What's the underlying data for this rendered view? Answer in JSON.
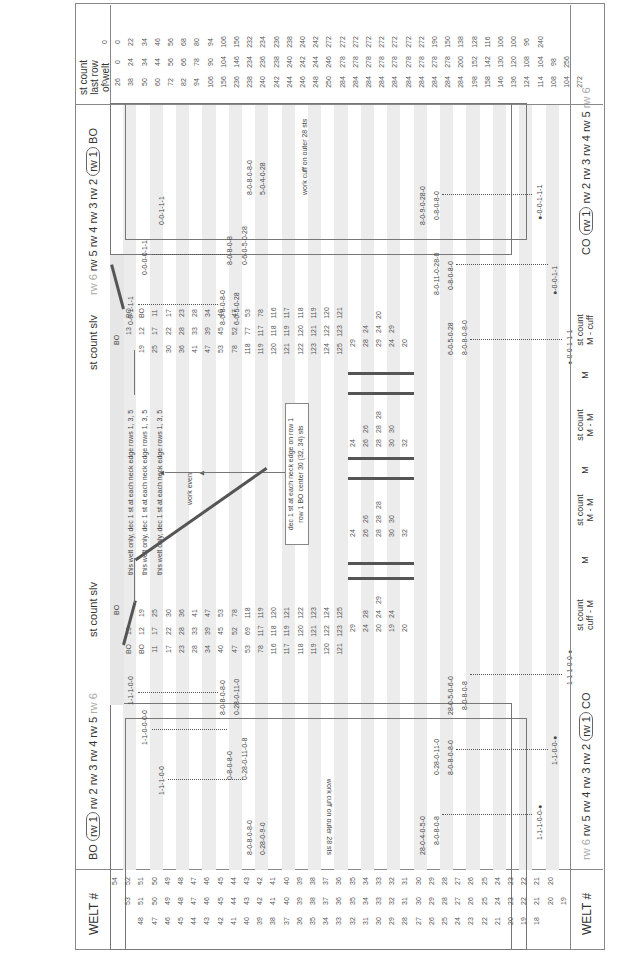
{
  "header": {
    "welt_label": "WELT #",
    "left_rows_label": {
      "bo": "BO",
      "rw1": "rw 1",
      "rest": "rw 2  rw 3  rw 4  rw 5",
      "rw6": "rw 6"
    },
    "st_count_slv_left": "st count slv",
    "st_count_slv_right": "st count slv",
    "right_rows_label": {
      "rw6": "rw 6",
      "rest": "rw 5  rw 4  rw 3  rw 2",
      "rw1": "rw 1",
      "bo": "BO"
    },
    "last_row_label": "st count\nlast row\nof welt"
  },
  "footer": {
    "welt_label": "WELT #",
    "left_rows_label": {
      "rw6": "rw 6",
      "rest": "rw 5  rw 4  rw 3  rw 2",
      "rw1": "rw 1",
      "co": "CO"
    },
    "st_count_cuff_m": "st count\ncuff - M",
    "m1": "M",
    "st_count_m_m_1": "st count\nM - M",
    "m2": "M",
    "st_count_m_m_2": "st count\nM - M",
    "m3": "M",
    "st_count_m_cuff": "st count\nM - cuff",
    "right_rows_label": {
      "co": "CO",
      "rw1": "rw 1",
      "rest": "rw 2  rw 3  rw 4  rw 5",
      "rw6": "rw 6"
    }
  },
  "notes": {
    "work_cuff_left": "work cuff on outer 28 sts",
    "work_cuff_right": "work cuff on outer 28 sts",
    "welt_dec_1": "this welt only, dec 1 st at each neck edge rows 1, 3, 5",
    "welt_dec_2": "this welt only, dec 1 st at each neck edge rows 1, 3, 5",
    "welt_dec_3": "this welt only, dec 1 st at each neck edge rows 1, 3, 5",
    "work_even": "work even",
    "neck_dec": "dec 1 st at each neck edge on row 1",
    "bo_center": "row 1 BO center  30 (32, 34) sts",
    "bo": "BO"
  },
  "welt_numbers": {
    "col1": [
      "54",
      "52",
      "50",
      "48",
      "46",
      "44",
      "42",
      "40",
      "38",
      "36",
      "34",
      "32",
      "30",
      "28",
      "26",
      "24",
      "22"
    ],
    "col1_full": [
      "54",
      "52",
      "51",
      "50",
      "49",
      "48",
      "47",
      "46",
      "45",
      "44",
      "43",
      "42",
      "41",
      "40",
      "39",
      "38",
      "37",
      "36",
      "35",
      "34",
      "33",
      "32",
      "31",
      "30",
      "29",
      "28",
      "27",
      "26",
      "25",
      "24",
      "23",
      "22",
      "21",
      "20"
    ],
    "col2_full": [
      "53",
      "51",
      "50",
      "49",
      "48",
      "47",
      "46",
      "45",
      "44",
      "43",
      "42",
      "41",
      "40",
      "39",
      "38",
      "37",
      "36",
      "35",
      "34",
      "33",
      "32",
      "31",
      "30",
      "29",
      "28",
      "27",
      "26",
      "25",
      "24",
      "23",
      "22",
      "21",
      "20",
      "19"
    ],
    "col3_full": [
      "48",
      "47",
      "46",
      "45",
      "44",
      "43",
      "42",
      "41",
      "40",
      "39",
      "38",
      "37",
      "36",
      "35",
      "34",
      "33",
      "32",
      "31",
      "30",
      "29",
      "28",
      "27",
      "26",
      "25",
      "24",
      "23",
      "22",
      "21",
      "20",
      "19",
      "18"
    ]
  },
  "last_row_counts": {
    "col_a": [
      "0",
      "0",
      "22",
      "34",
      "46",
      "56",
      "68",
      "80",
      "94",
      "106",
      "156",
      "232",
      "234",
      "236",
      "238",
      "240",
      "242",
      "272",
      "272",
      "272",
      "272",
      "272",
      "272",
      "272",
      "272",
      "190",
      "150",
      "138",
      "128",
      "116",
      "106",
      "100",
      "96",
      "240"
    ],
    "col_b": [
      "0",
      "24",
      "34",
      "44",
      "56",
      "66",
      "78",
      "90",
      "104",
      "146",
      "234",
      "236",
      "238",
      "240",
      "242",
      "244",
      "246",
      "278",
      "278",
      "278",
      "278",
      "278",
      "278",
      "278",
      "278",
      "278",
      "200",
      "152",
      "142",
      "130",
      "120",
      "108",
      "104",
      "98",
      "256"
    ],
    "col_c": [
      "0",
      "26",
      "38",
      "50",
      "60",
      "72",
      "82",
      "94",
      "106",
      "156",
      "236",
      "238",
      "240",
      "242",
      "244",
      "246",
      "248",
      "250",
      "284",
      "284",
      "284",
      "284",
      "284",
      "284",
      "284",
      "284",
      "284",
      "284",
      "198",
      "158",
      "146",
      "136",
      "124",
      "114",
      "108",
      "104",
      "272"
    ]
  },
  "left_slv_counts": [
    [
      "BO",
      "13",
      ""
    ],
    [
      "BO",
      "12",
      "19"
    ],
    [
      "11",
      "17",
      "25"
    ],
    [
      "17",
      "22",
      "30"
    ],
    [
      "23",
      "28",
      "36"
    ],
    [
      "28",
      "33",
      "41"
    ],
    [
      "34",
      "39",
      "47"
    ],
    [
      "40",
      "45",
      "53"
    ],
    [
      "47",
      "52",
      "78"
    ],
    [
      "53",
      "69",
      "118"
    ],
    [
      "78",
      "117",
      "119"
    ],
    [
      "116",
      "118",
      "120"
    ],
    [
      "117",
      "119",
      "121"
    ],
    [
      "118",
      "120",
      "122"
    ],
    [
      "119",
      "121",
      "123"
    ],
    [
      "120",
      "122",
      "124"
    ],
    [
      "121",
      "123",
      "125"
    ]
  ],
  "right_slv_counts": [
    [
      "",
      "13",
      "BO"
    ],
    [
      "19",
      "12",
      "BO"
    ],
    [
      "25",
      "17",
      "11"
    ],
    [
      "30",
      "22",
      "17"
    ],
    [
      "36",
      "28",
      "23"
    ],
    [
      "41",
      "33",
      "28"
    ],
    [
      "47",
      "39",
      "34"
    ],
    [
      "53",
      "45",
      "40"
    ],
    [
      "78",
      "52",
      "47"
    ],
    [
      "118",
      "77",
      "53"
    ],
    [
      "119",
      "117",
      "78"
    ],
    [
      "120",
      "118",
      "116"
    ],
    [
      "121",
      "119",
      "117"
    ],
    [
      "122",
      "120",
      "118"
    ],
    [
      "123",
      "121",
      "119"
    ],
    [
      "124",
      "122",
      "120"
    ],
    [
      "125",
      "123",
      "121"
    ]
  ],
  "left_sequences": {
    "s1": "1-1-1-0-0",
    "s2": "1-1-0-0-0-0",
    "s3": "1-1-1-0-0",
    "s4": "8-0-8-0-8-0",
    "s5": "0-28-0-11-0",
    "s6": "0-8-0-8-0",
    "s7": "0-28-0-11-0-8",
    "s8": "8-0-8-0-8-0",
    "s9": "0-28-0-9-0",
    "s10": "28-0-4-0-5-0",
    "s11": "8-0-8-0-8",
    "s12": "0-28-0-11-0",
    "s13": "8-0-8-0-8-0",
    "s14": "28-0-5-0-6-0",
    "s15": "8-0-8-0-8",
    "s16": "1-1-1-0-0-●",
    "s17": "1-1-0-0-●",
    "s18": "1-1-1-0-0-●"
  },
  "right_sequences": {
    "s1": "0-0-1-1-1",
    "s2": "0-0-0-0-1-1",
    "s3": "0-0-1-1-1",
    "s4": "8-0-8-0-8-0",
    "s5": "6-0-5-0-28",
    "s6": "8-0-8-0-8",
    "s7": "0-6-0-5-0-28",
    "s8": "8-0-8-0-8-0",
    "s9": "5-0-4-0-28",
    "s10": "8-0-9-0-28-0",
    "s11": "0-8-0-8-0",
    "s12": "8-0-11-0-28-0",
    "s13": "0-8-0-8-0",
    "s14": "6-0-5-0-28",
    "s15": "8-0-8-0-8-0",
    "s16": "●-0-0-1-1-1",
    "s17": "●-0-0-1-1",
    "s18": "●-0-0-1-1-1"
  },
  "cuff_counts_left": [
    [
      "29"
    ],
    [
      "24",
      "28"
    ],
    [
      "20",
      "24",
      "29"
    ],
    [
      "19",
      "24"
    ],
    [
      "20"
    ]
  ],
  "cuff_counts_mm1": [
    [
      "24"
    ],
    [
      "26",
      "26"
    ],
    [
      "28",
      "28",
      "28"
    ],
    [
      "30",
      "30"
    ],
    [
      "32"
    ]
  ],
  "cuff_counts_mm2": [
    [
      "24"
    ],
    [
      "26",
      "26"
    ],
    [
      "28",
      "28",
      "28"
    ],
    [
      "30",
      "30"
    ],
    [
      "32"
    ]
  ],
  "cuff_counts_right": [
    [
      "29"
    ],
    [
      "28",
      "24"
    ],
    [
      "29",
      "24",
      "20"
    ],
    [
      "24",
      "29"
    ],
    [
      "20"
    ]
  ],
  "colors": {
    "shade": "#e6e6e6",
    "line": "#888888",
    "thick": "#555555",
    "text": "#444444"
  }
}
